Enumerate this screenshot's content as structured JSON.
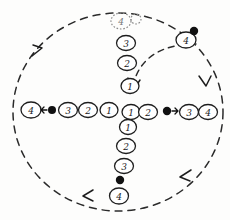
{
  "figure": {
    "type": "hand-drawn-diagram",
    "background_color": "#fdfdfc",
    "ink_color": "#1a1a1a",
    "ghost_ink_color": "#777777"
  },
  "boundary": {
    "name": "dashed-circle",
    "cx": 118,
    "cy": 112,
    "rx": 105,
    "ry": 100,
    "stroke": "#2b2b2b",
    "dash": "7 6"
  },
  "arrowheads": [
    {
      "name": "arrow-upper-left",
      "x": 38,
      "y": 50,
      "angle": -48
    },
    {
      "name": "arrow-right",
      "x": 205,
      "y": 82,
      "angle": 70
    },
    {
      "name": "arrow-lower-right",
      "x": 183,
      "y": 176,
      "angle": 190
    },
    {
      "name": "arrow-bottom",
      "x": 85,
      "y": 196,
      "angle": 200
    },
    {
      "name": "arrow-inner-curve",
      "x": 134,
      "y": 84,
      "angle": 110
    }
  ],
  "center": {
    "x": 130,
    "y": 110
  },
  "arms": {
    "up": {
      "name": "arm-up",
      "labels": [
        "1",
        "2",
        "3"
      ],
      "terminal": {
        "label": "4",
        "style": "dotted"
      },
      "companion_dot": {
        "style": "dotted-open"
      }
    },
    "down": {
      "name": "arm-down",
      "labels": [
        "1",
        "2",
        "3"
      ],
      "marker": "filled-dot",
      "terminal": {
        "label": "4",
        "style": "solid"
      }
    },
    "left": {
      "name": "arm-left",
      "labels": [
        "1",
        "2",
        "3"
      ],
      "marker": "filled-dot-arrow-left",
      "terminal": {
        "label": "4",
        "style": "solid"
      }
    },
    "right": {
      "name": "arm-right",
      "labels": [
        "1",
        "2"
      ],
      "marker": "filled-dot-arrow-right",
      "after_marker": [
        "3",
        "4"
      ]
    }
  },
  "satellite": {
    "name": "satellite-node-top-right",
    "label": "4",
    "x": 186,
    "y": 40,
    "dot": {
      "x": 194,
      "y": 31
    }
  },
  "nodes": [
    {
      "name": "node-up-1",
      "label": "1",
      "x": 130,
      "y": 86,
      "style": "solid"
    },
    {
      "name": "node-up-2",
      "label": "2",
      "x": 127,
      "y": 63,
      "style": "solid"
    },
    {
      "name": "node-up-3",
      "label": "3",
      "x": 126,
      "y": 43,
      "style": "solid"
    },
    {
      "name": "node-up-4",
      "label": "4",
      "x": 121,
      "y": 21,
      "style": "dotted"
    },
    {
      "name": "node-up-companion",
      "label": "",
      "x": 135,
      "y": 19,
      "style": "dotted-open"
    },
    {
      "name": "node-center-left-1",
      "label": "1",
      "x": 109,
      "y": 110,
      "style": "solid"
    },
    {
      "name": "node-center-right-1",
      "label": "1",
      "x": 131,
      "y": 112,
      "style": "solid"
    },
    {
      "name": "node-center-right-2",
      "label": "2",
      "x": 148,
      "y": 112,
      "style": "solid"
    },
    {
      "name": "node-left-2",
      "label": "2",
      "x": 88,
      "y": 110,
      "style": "solid"
    },
    {
      "name": "node-left-3",
      "label": "3",
      "x": 68,
      "y": 110,
      "style": "solid"
    },
    {
      "name": "node-left-dot",
      "label": "",
      "x": 52,
      "y": 110,
      "style": "filled-dot"
    },
    {
      "name": "node-left-4",
      "label": "4",
      "x": 31,
      "y": 110,
      "style": "solid"
    },
    {
      "name": "node-right-dot",
      "label": "",
      "x": 167,
      "y": 111,
      "style": "filled-dot"
    },
    {
      "name": "node-right-3",
      "label": "3",
      "x": 189,
      "y": 112,
      "style": "solid"
    },
    {
      "name": "node-right-4",
      "label": "4",
      "x": 208,
      "y": 112,
      "style": "solid"
    },
    {
      "name": "node-down-1",
      "label": "1",
      "x": 128,
      "y": 127,
      "style": "solid"
    },
    {
      "name": "node-down-2",
      "label": "2",
      "x": 126,
      "y": 146,
      "style": "solid"
    },
    {
      "name": "node-down-3",
      "label": "3",
      "x": 124,
      "y": 166,
      "style": "solid"
    },
    {
      "name": "node-down-dot",
      "label": "",
      "x": 120,
      "y": 180,
      "style": "filled-dot"
    },
    {
      "name": "node-down-4",
      "label": "4",
      "x": 119,
      "y": 196,
      "style": "solid"
    },
    {
      "name": "node-satellite-4",
      "label": "4",
      "x": 186,
      "y": 40,
      "style": "solid"
    },
    {
      "name": "node-satellite-dot",
      "label": "",
      "x": 194,
      "y": 31,
      "style": "filled-dot"
    }
  ]
}
